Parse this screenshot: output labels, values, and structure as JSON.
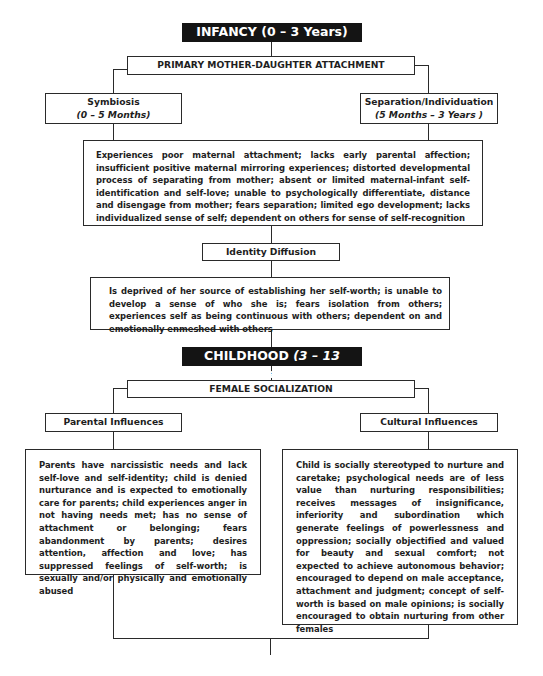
{
  "infancy": {
    "header_main": "INFANCY (0 – 3 Years)",
    "attachment": "PRIMARY MOTHER-DAUGHTER ATTACHMENT",
    "symbiosis": {
      "title": "Symbiosis",
      "range": "(0 – 5 Months)"
    },
    "separation": {
      "title": "Separation/Individuation",
      "range": "(5 Months – 3 Years )"
    },
    "experiences": "Experiences poor maternal attachment; lacks early parental affection; insufficient positive maternal mirroring experiences; distorted developmental process of separating from mother; absent or limited maternal-infant self-identification and self-love; unable to psychologically differentiate, distance and disengage from mother; fears separation; limited ego development; lacks individualized sense of self; dependent on others for sense of self-recognition",
    "identity": "Identity Diffusion",
    "identity_desc": "Is deprived of her source of establishing her self-worth; is unable to develop a sense of who she is; fears isolation from others; experiences self as being continuous with others; dependent on and emotionally enmeshed with others"
  },
  "childhood": {
    "header_main": "CHILDHOOD",
    "header_range": " (3 – 13 Years)",
    "socialization": "FEMALE SOCIALIZATION",
    "parental": {
      "title": "Parental Influences",
      "desc": "Parents have narcissistic needs and lack self-love and self-identity; child is denied nurturance and is expected to emotionally care for parents; child experiences anger in not having needs met; has no sense of attachment or belonging; fears abandonment by parents; desires attention, affection and love; has suppressed feelings of self-worth; is sexually and/or physically and emotionally abused"
    },
    "cultural": {
      "title": "Cultural Influences",
      "desc": "Child is socially stereotyped to nurture and caretake; psychological needs are of less value than nurturing responsibilities; receives messages of insignificance, inferiority and subordination which generate feelings of powerlessness and oppression; socially objectified and valued for beauty and sexual comfort; not expected to achieve autonomous behavior; encouraged to depend on male acceptance, attachment and judgment; concept of self-worth is based on male opinions; is socially encouraged to obtain nurturing from other females"
    }
  }
}
